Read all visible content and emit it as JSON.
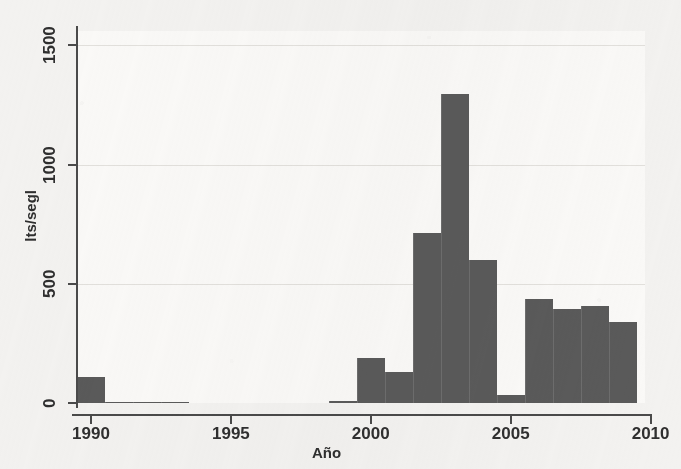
{
  "chart_data": {
    "type": "bar",
    "title": "",
    "subtitle": "",
    "xlabel": "Año",
    "ylabel": "lts/segl",
    "xlim": [
      1989.5,
      2009.8
    ],
    "ylim": [
      0,
      1560
    ],
    "grid": true,
    "legend": null,
    "legend_position": "none",
    "x_ticks": [
      "1990",
      "1995",
      "2000",
      "2005",
      "2010"
    ],
    "x_tick_values": [
      1990,
      1995,
      2000,
      2005,
      2010
    ],
    "y_ticks": [
      "0",
      "500",
      "1000",
      "1500"
    ],
    "y_tick_values": [
      0,
      500,
      1000,
      1500
    ],
    "bar_color": "#5a5a5a",
    "bin_width": 1,
    "note": "histograma de caudal por año; barras de un año de ancho",
    "categories": [
      1990,
      1991,
      1992,
      1993,
      1999,
      2000,
      2001,
      2002,
      2003,
      2004,
      2005,
      2006,
      2007,
      2008,
      2009
    ],
    "values": [
      110,
      0,
      5,
      5,
      10,
      190,
      130,
      715,
      1295,
      600,
      35,
      435,
      395,
      405,
      340
    ],
    "bars": [
      {
        "year": 1990,
        "x_start": 1989.5,
        "x_end": 1990.5,
        "value": 110
      },
      {
        "year": 1991,
        "x_start": 1990.5,
        "x_end": 1991.5,
        "value": 0
      },
      {
        "year": 1992,
        "x_start": 1991.5,
        "x_end": 1992.5,
        "value": 5
      },
      {
        "year": 1993,
        "x_start": 1992.5,
        "x_end": 1993.5,
        "value": 5
      },
      {
        "year": 1999,
        "x_start": 1998.5,
        "x_end": 1999.5,
        "value": 10
      },
      {
        "year": 2000,
        "x_start": 1999.5,
        "x_end": 2000.5,
        "value": 190
      },
      {
        "year": 2001,
        "x_start": 2000.5,
        "x_end": 2001.5,
        "value": 130
      },
      {
        "year": 2002,
        "x_start": 2001.5,
        "x_end": 2002.5,
        "value": 715
      },
      {
        "year": 2003,
        "x_start": 2002.5,
        "x_end": 2003.5,
        "value": 1295
      },
      {
        "year": 2004,
        "x_start": 2003.5,
        "x_end": 2004.5,
        "value": 600
      },
      {
        "year": 2005,
        "x_start": 2004.5,
        "x_end": 2005.5,
        "value": 35
      },
      {
        "year": 2006,
        "x_start": 2005.5,
        "x_end": 2006.5,
        "value": 435
      },
      {
        "year": 2007,
        "x_start": 2006.5,
        "x_end": 2007.5,
        "value": 395
      },
      {
        "year": 2008,
        "x_start": 2007.5,
        "x_end": 2008.5,
        "value": 405
      },
      {
        "year": 2009,
        "x_start": 2008.5,
        "x_end": 2009.5,
        "value": 340
      }
    ]
  },
  "axes": {
    "y_title": "lts/segl",
    "x_title": "Año"
  }
}
